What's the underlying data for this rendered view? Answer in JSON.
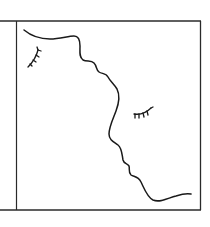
{
  "figure": {
    "caption": "",
    "colors": {
      "background": "#ffffff",
      "stroke": "#1a1a1a",
      "frame": "#2a2a2a"
    },
    "elements": {
      "frame": "rectangular border",
      "divider": "left vertical line",
      "profile": "wavy face profile line",
      "eye_left": "closed eye with lashes (upper left)",
      "eye_right": "closed eye with lashes (center right)"
    }
  }
}
